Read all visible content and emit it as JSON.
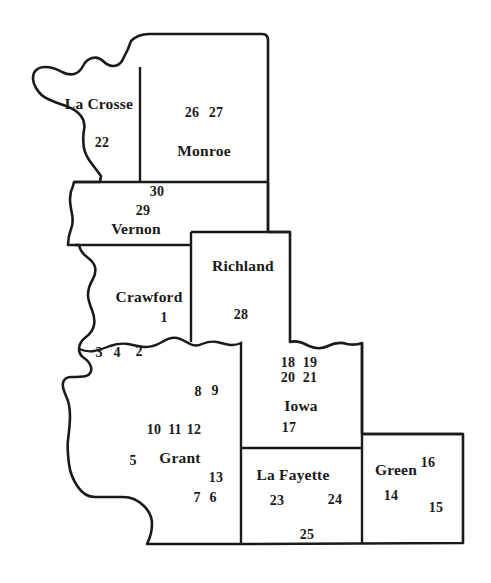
{
  "map": {
    "title": "Southwestern Wisconsin County Map with Numbered Archaeological Sites",
    "region": "Southwestern Wisconsin",
    "background_color": "#ffffff",
    "line_color": "#1a1a1a",
    "counties": [
      {
        "name": "La Crosse",
        "label_x": 99,
        "label_y": 104,
        "sites": [
          {
            "number": "22",
            "x": 102,
            "y": 143
          }
        ]
      },
      {
        "name": "Monroe",
        "label_x": 204,
        "label_y": 151,
        "sites": [
          {
            "number": "26",
            "x": 192,
            "y": 113
          },
          {
            "number": "27",
            "x": 216,
            "y": 113
          }
        ]
      },
      {
        "name": "Vernon",
        "label_x": 136,
        "label_y": 229,
        "sites": [
          {
            "number": "30",
            "x": 157,
            "y": 192
          },
          {
            "number": "29",
            "x": 143,
            "y": 211
          }
        ]
      },
      {
        "name": "Crawford",
        "label_x": 149,
        "label_y": 297,
        "sites": [
          {
            "number": "1",
            "x": 164,
            "y": 318
          },
          {
            "number": "3",
            "x": 99,
            "y": 353
          },
          {
            "number": "4",
            "x": 117,
            "y": 353
          },
          {
            "number": "2",
            "x": 139,
            "y": 352
          }
        ]
      },
      {
        "name": "Richland",
        "label_x": 243,
        "label_y": 266,
        "sites": [
          {
            "number": "28",
            "x": 241,
            "y": 315
          }
        ]
      },
      {
        "name": "Grant",
        "label_x": 180,
        "label_y": 458,
        "sites": [
          {
            "number": "8",
            "x": 198,
            "y": 392
          },
          {
            "number": "9",
            "x": 215,
            "y": 391
          },
          {
            "number": "10",
            "x": 154,
            "y": 430
          },
          {
            "number": "11",
            "x": 175,
            "y": 430
          },
          {
            "number": "12",
            "x": 194,
            "y": 430
          },
          {
            "number": "5",
            "x": 133,
            "y": 461
          },
          {
            "number": "13",
            "x": 216,
            "y": 478
          },
          {
            "number": "7",
            "x": 197,
            "y": 498
          },
          {
            "number": "6",
            "x": 213,
            "y": 498
          }
        ]
      },
      {
        "name": "Iowa",
        "label_x": 301,
        "label_y": 406,
        "sites": [
          {
            "number": "18",
            "x": 288,
            "y": 363
          },
          {
            "number": "19",
            "x": 310,
            "y": 363
          },
          {
            "number": "20",
            "x": 288,
            "y": 378
          },
          {
            "number": "21",
            "x": 310,
            "y": 378
          },
          {
            "number": "17",
            "x": 289,
            "y": 428
          }
        ]
      },
      {
        "name": "La Fayette",
        "label_x": 293,
        "label_y": 475,
        "sites": [
          {
            "number": "23",
            "x": 277,
            "y": 501
          },
          {
            "number": "24",
            "x": 335,
            "y": 500
          },
          {
            "number": "25",
            "x": 307,
            "y": 535
          }
        ]
      },
      {
        "name": "Green",
        "label_x": 396,
        "label_y": 470,
        "sites": [
          {
            "number": "16",
            "x": 428,
            "y": 463
          },
          {
            "number": "14",
            "x": 391,
            "y": 496
          },
          {
            "number": "15",
            "x": 436,
            "y": 508
          }
        ]
      }
    ]
  }
}
